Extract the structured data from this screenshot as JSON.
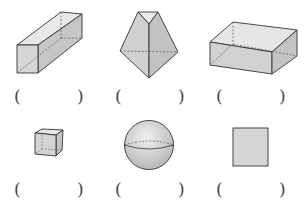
{
  "diagram": {
    "type": "worksheet-3d-shapes-identification",
    "answer_blank": {
      "open": "(",
      "close": ")",
      "value": ""
    },
    "shapes": [
      {
        "name": "rectangular-prism-long",
        "row": 1,
        "col": 1
      },
      {
        "name": "triangular-prism",
        "row": 1,
        "col": 2
      },
      {
        "name": "rectangular-prism-flat",
        "row": 1,
        "col": 3
      },
      {
        "name": "cube",
        "row": 2,
        "col": 1
      },
      {
        "name": "sphere",
        "row": 2,
        "col": 2
      },
      {
        "name": "rectangle",
        "row": 2,
        "col": 3
      }
    ],
    "colors": {
      "fill_light": "#e6e6e6",
      "fill_mid": "#d2d2d2",
      "fill_dark": "#bdbdbd",
      "stroke": "#333333",
      "hidden_edge": "#555555"
    }
  }
}
